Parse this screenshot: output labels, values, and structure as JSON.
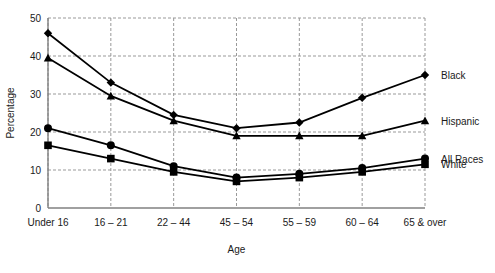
{
  "chart_data": {
    "type": "line",
    "title": "",
    "xlabel": "Age",
    "ylabel": "Percentage",
    "categories": [
      "Under 16",
      "16 – 21",
      "22 – 44",
      "45 – 54",
      "55 – 59",
      "60 – 64",
      "65 & over"
    ],
    "ylim": [
      0,
      50
    ],
    "yticks": [
      0,
      10,
      20,
      30,
      40,
      50
    ],
    "ytick_labels": [
      "0",
      "10",
      "20",
      "30",
      "40",
      "50"
    ],
    "grid": true,
    "grid_style": "dashed",
    "legend_position": "right-inline",
    "series": [
      {
        "name": "Black",
        "marker": "diamond",
        "values": [
          46,
          33,
          24.5,
          21,
          22.5,
          29,
          35
        ]
      },
      {
        "name": "Hispanic",
        "marker": "triangle",
        "values": [
          39.5,
          29.5,
          23,
          19,
          19,
          19,
          23
        ]
      },
      {
        "name": "All Races",
        "marker": "circle",
        "values": [
          21,
          16.5,
          11,
          8,
          9,
          10.5,
          13
        ]
      },
      {
        "name": "White",
        "marker": "square",
        "values": [
          16.5,
          13,
          9.5,
          7,
          8,
          9.5,
          11.5
        ]
      }
    ],
    "colors": {
      "line": "#000000",
      "grid": "#999999",
      "axis": "#808080",
      "text": "#1a1a1a"
    }
  }
}
